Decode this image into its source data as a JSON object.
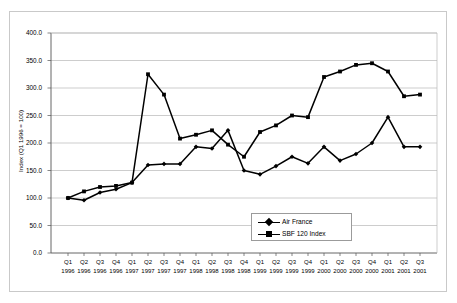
{
  "chart_data": {
    "type": "line",
    "title": "",
    "xlabel": "",
    "ylabel": "Index (Q1 1996 = 100)",
    "ylim": [
      0.0,
      400.0
    ],
    "ytick_step": 50.0,
    "yticks": [
      "0.0",
      "50.0",
      "100.0",
      "150.0",
      "200.0",
      "250.0",
      "300.0",
      "350.0",
      "400.0"
    ],
    "grid": true,
    "grid_axis": "y",
    "legend_position": "inside-lower-right",
    "categories": [
      "Q1 1996",
      "Q2 1996",
      "Q3 1996",
      "Q4 1996",
      "Q1 1997",
      "Q2 1997",
      "Q3 1997",
      "Q4 1997",
      "Q1 1998",
      "Q2 1998",
      "Q3 1998",
      "Q4 1998",
      "Q1 1999",
      "Q2 1999",
      "Q3 1999",
      "Q4 1999",
      "Q1 2000",
      "Q2 2000",
      "Q3 2000",
      "Q4 2000",
      "Q1 2001",
      "Q2 2001",
      "Q3 2001"
    ],
    "quarter_labels": [
      "Q1",
      "Q2",
      "Q3",
      "Q4",
      "Q1",
      "Q2",
      "Q3",
      "Q4",
      "Q1",
      "Q2",
      "Q3",
      "Q4",
      "Q1",
      "Q2",
      "Q3",
      "Q4",
      "Q1",
      "Q2",
      "Q3",
      "Q4",
      "Q1",
      "Q2",
      "Q3"
    ],
    "year_labels": [
      "1996",
      "1996",
      "1996",
      "1996",
      "1997",
      "1997",
      "1997",
      "1997",
      "1998",
      "1998",
      "1998",
      "1998",
      "1999",
      "1999",
      "1999",
      "1999",
      "2000",
      "2000",
      "2000",
      "2000",
      "2001",
      "2001",
      "2001"
    ],
    "series": [
      {
        "name": "Air France",
        "color": "#000000",
        "marker": "diamond",
        "values": [
          100,
          96,
          110,
          116,
          128,
          160,
          162,
          162,
          193,
          190,
          223,
          150,
          143,
          158,
          175,
          163,
          193,
          168,
          180,
          200,
          247,
          193,
          193
        ]
      },
      {
        "name": "SBF 120 Index",
        "color": "#000000",
        "marker": "square",
        "values": [
          100,
          112,
          120,
          122,
          128,
          325,
          288,
          208,
          215,
          223,
          197,
          175,
          220,
          232,
          250,
          247,
          320,
          330,
          342,
          345,
          330,
          285,
          288
        ]
      }
    ]
  },
  "legend": {
    "items": [
      {
        "label": "Air France"
      },
      {
        "label": "SBF 120 Index"
      }
    ]
  }
}
